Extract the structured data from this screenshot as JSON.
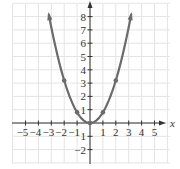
{
  "chart_data": {
    "type": "line",
    "title": "",
    "xlabel": "x",
    "ylabel": "y",
    "function": "y = 0.8x^2",
    "xlim": [
      -5.5,
      5.5
    ],
    "ylim": [
      -2.8,
      8.8
    ],
    "grid": true,
    "x_ticks": [
      -5,
      -4,
      -3,
      -2,
      -1,
      1,
      2,
      3,
      4,
      5
    ],
    "x_tick_labels": [
      "−5",
      "−4",
      "−3",
      "−2",
      "−1",
      "1",
      "2",
      "3",
      "4",
      "5"
    ],
    "y_ticks": [
      1,
      2,
      3,
      4,
      5,
      6,
      7,
      8,
      -1,
      -2
    ],
    "y_tick_labels": [
      "1",
      "2",
      "3",
      "4",
      "5",
      "6",
      "7",
      "8",
      "",
      "−2"
    ],
    "marked_points": [
      {
        "x": -2,
        "y": 3.2
      },
      {
        "x": -1,
        "y": 0.8
      },
      {
        "x": 0,
        "y": 0
      },
      {
        "x": 1,
        "y": 0.8
      },
      {
        "x": 2,
        "y": 3.2
      }
    ],
    "curve_x_range": [
      -3.2,
      3.2
    ],
    "colors": {
      "curve": "#6b6b6b",
      "grid": "#e4e4e4",
      "axis": "#333333"
    }
  }
}
